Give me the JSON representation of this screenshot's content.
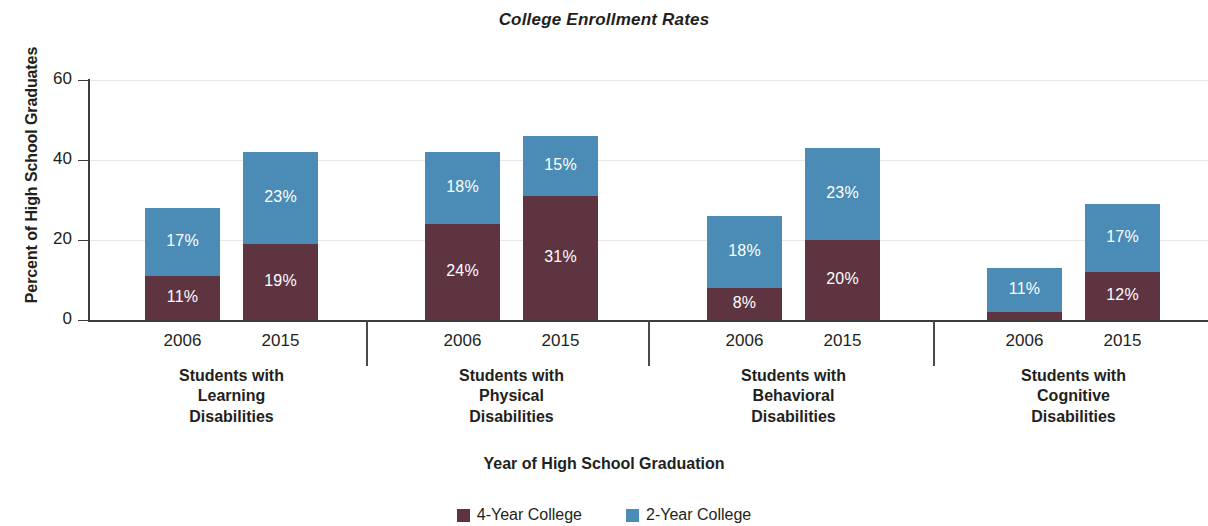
{
  "chart_data": {
    "type": "bar",
    "subtype": "stacked-bar-grouped",
    "title": "College Enrollment Rates",
    "xlabel": "Year of High School Graduation",
    "ylabel": "Percent of High School Graduates",
    "ylim": [
      0,
      60
    ],
    "yticks": [
      0,
      20,
      40,
      60
    ],
    "ytick_labels": [
      "0",
      "20",
      "40",
      "60"
    ],
    "grid": true,
    "legend_position": "bottom",
    "categories": [
      "2006",
      "2015",
      "2006",
      "2015",
      "2006",
      "2015",
      "2006",
      "2015"
    ],
    "groups": [
      {
        "label_lines": [
          "Students with",
          "Learning",
          "Disabilities"
        ],
        "bars": [
          {
            "year": "2006",
            "four_year": 11,
            "two_year": 17,
            "total": 28,
            "four_year_label": "11%",
            "two_year_label": "17%"
          },
          {
            "year": "2015",
            "four_year": 19,
            "two_year": 23,
            "total": 42,
            "four_year_label": "19%",
            "two_year_label": "23%"
          }
        ]
      },
      {
        "label_lines": [
          "Students with",
          "Physical",
          "Disabilities"
        ],
        "bars": [
          {
            "year": "2006",
            "four_year": 24,
            "two_year": 18,
            "total": 42,
            "four_year_label": "24%",
            "two_year_label": "18%"
          },
          {
            "year": "2015",
            "four_year": 31,
            "two_year": 15,
            "total": 46,
            "four_year_label": "31%",
            "two_year_label": "15%"
          }
        ]
      },
      {
        "label_lines": [
          "Students with",
          "Behavioral",
          "Disabilities"
        ],
        "bars": [
          {
            "year": "2006",
            "four_year": 8,
            "two_year": 18,
            "total": 26,
            "four_year_label": "8%",
            "two_year_label": "18%"
          },
          {
            "year": "2015",
            "four_year": 20,
            "two_year": 23,
            "total": 43,
            "four_year_label": "20%",
            "two_year_label": "23%"
          }
        ]
      },
      {
        "label_lines": [
          "Students with",
          "Cognitive",
          "Disabilities"
        ],
        "bars": [
          {
            "year": "2006",
            "four_year": 2,
            "two_year": 11,
            "total": 13,
            "four_year_label": "2%",
            "two_year_label": "11%"
          },
          {
            "year": "2015",
            "four_year": 12,
            "two_year": 17,
            "total": 29,
            "four_year_label": "12%",
            "two_year_label": "17%"
          }
        ]
      }
    ],
    "series": [
      {
        "name": "4-Year College",
        "color": "#5e3440",
        "values": [
          11,
          19,
          24,
          31,
          8,
          20,
          2,
          12
        ]
      },
      {
        "name": "2-Year College",
        "color": "#4a8cb5",
        "values": [
          17,
          23,
          18,
          15,
          18,
          23,
          11,
          17
        ]
      }
    ],
    "legend": [
      {
        "label": "4-Year College",
        "color": "#5e3440"
      },
      {
        "label": "2-Year College",
        "color": "#4a8cb5"
      }
    ]
  },
  "colors": {
    "four_year": "#5e3440",
    "two_year": "#4a8cb5",
    "axis": "#3c3c3c",
    "grid": "#e9e6e4",
    "text": "#231f20",
    "background": "#ffffff"
  }
}
